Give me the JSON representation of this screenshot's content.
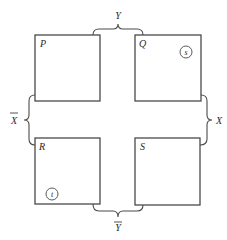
{
  "diagram": {
    "regions": [
      {
        "id": "P",
        "label": "P",
        "x": 35,
        "y": 35,
        "w": 65,
        "h": 66
      },
      {
        "id": "Q",
        "label": "Q",
        "x": 135,
        "y": 35,
        "w": 66,
        "h": 66
      },
      {
        "id": "R",
        "label": "R",
        "x": 35,
        "y": 138,
        "w": 65,
        "h": 66
      },
      {
        "id": "S",
        "label": "S",
        "x": 135,
        "y": 138,
        "w": 65,
        "h": 67
      }
    ],
    "markers": [
      {
        "label": "s",
        "region": "Q",
        "cx": 186,
        "cy": 52,
        "r": 6
      },
      {
        "label": "t",
        "region": "R",
        "cx": 52,
        "cy": 194,
        "r": 6
      }
    ],
    "braces": {
      "top": {
        "label": "Y",
        "negated": false
      },
      "bottom": {
        "label": "Y",
        "negated": true
      },
      "left": {
        "label": "X",
        "negated": true
      },
      "right": {
        "label": "X",
        "negated": false
      }
    }
  }
}
